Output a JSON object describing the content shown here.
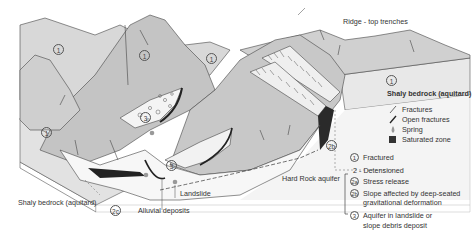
{
  "diagram": {
    "labels": {
      "ridge": "Ridge - top trenches",
      "shaly_right": "Shaly bedrock (aquitard)",
      "shaly_left": "Shaly bedrock (aquitard)",
      "hard_rock": "Hard Rock aquifer",
      "landslide": "Landslide",
      "alluvial": "Alluvial deposits"
    },
    "map_markers": [
      {
        "id": "m1",
        "text": "1"
      },
      {
        "id": "m2",
        "text": "1"
      },
      {
        "id": "m3",
        "text": "1"
      },
      {
        "id": "m4",
        "text": "1"
      },
      {
        "id": "m5",
        "text": "1"
      },
      {
        "id": "m6",
        "text": "3"
      },
      {
        "id": "m7",
        "text": "3"
      },
      {
        "id": "m8",
        "text": "2b"
      },
      {
        "id": "m9",
        "text": "2c"
      }
    ],
    "legend_symbols": [
      {
        "icon": "fracture-icon",
        "label": "Fractures"
      },
      {
        "icon": "open-fracture-icon",
        "label": "Open fractures"
      },
      {
        "icon": "spring-icon",
        "label": "Spring"
      },
      {
        "icon": "saturated-zone-icon",
        "label": "Saturated zone"
      }
    ],
    "legend_zones": [
      {
        "marker": "1",
        "label": "Fractured"
      },
      {
        "marker": "",
        "label": "2 - Detensioned"
      },
      {
        "marker": "2a",
        "label": "Stress release"
      },
      {
        "marker": "2b",
        "label": "Slope affected by deep-seated",
        "label2": "gravitational deformation"
      },
      {
        "marker": "3",
        "label": "Aquifer in landslide or",
        "label2": "slope debris deposit"
      }
    ],
    "colors": {
      "mountain": "#c9c9c9",
      "mountain_dark": "#b5b5b5",
      "light_band": "#e6e6e6",
      "outline": "#444444",
      "saturated": "#222222",
      "spring": "#9a9a9a"
    }
  }
}
